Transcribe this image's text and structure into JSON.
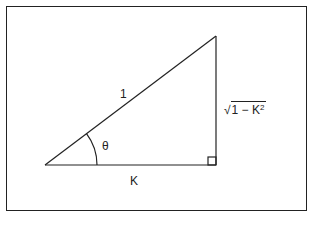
{
  "diagram": {
    "type": "right-triangle",
    "labels": {
      "hypotenuse": "1",
      "angle": "θ",
      "adjacent": "K",
      "opposite_radical": "√",
      "opposite_body": "1 − K",
      "opposite_exponent": "2"
    },
    "colors": {
      "stroke": "#222222",
      "background": "#ffffff"
    }
  }
}
